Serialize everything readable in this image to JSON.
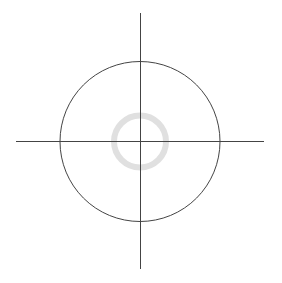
{
  "diagram": {
    "type": "crosshair-target",
    "background": "#ffffff",
    "center": {
      "x": 140,
      "y": 141
    },
    "vertical_axis": {
      "x": 140,
      "y1": 13,
      "y2": 269,
      "color": "#444444",
      "width": 1
    },
    "horizontal_axis": {
      "y": 141.5,
      "x1": 16,
      "x2": 264,
      "color": "#444444",
      "width": 1
    },
    "outer_circle": {
      "cx": 140,
      "cy": 141.5,
      "r": 80,
      "color": "#444444",
      "width": 1
    },
    "inner_ring": {
      "cx": 140,
      "cy": 141.5,
      "r": 26,
      "color": "#e0e0e0",
      "width": 6
    }
  }
}
